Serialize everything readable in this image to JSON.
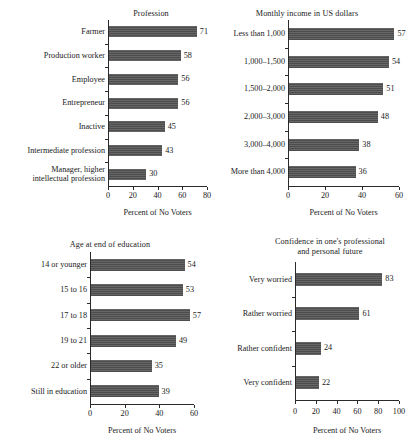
{
  "figure": {
    "shared_xlabel": "Percent of No Voters",
    "bar_color": "#4d4d4d",
    "axis_color": "#2a2a2a",
    "background": "#ffffff"
  },
  "chart_data": [
    {
      "type": "bar",
      "orientation": "horizontal",
      "panel": "top-left",
      "title": "Profession",
      "xlabel": "Percent of No Voters",
      "ylabel": "",
      "xlim": [
        0,
        80
      ],
      "xticks": [
        0,
        20,
        40,
        60,
        80
      ],
      "grid": false,
      "legend": false,
      "categories": [
        "Farmer",
        "Production worker",
        "Employee",
        "Entrepreneur",
        "Inactive",
        "Intermediate profession",
        "Manager, higher\nintellectual profession"
      ],
      "values": [
        71,
        58,
        56,
        56,
        45,
        43,
        30
      ]
    },
    {
      "type": "bar",
      "orientation": "horizontal",
      "panel": "top-right",
      "title": "Monthly income in US dollars",
      "xlabel": "Percent of No Voters",
      "ylabel": "",
      "xlim": [
        0,
        60
      ],
      "xticks": [
        0,
        20,
        40,
        60
      ],
      "grid": false,
      "legend": false,
      "categories": [
        "Less than 1,000",
        "1,000–1,500",
        "1,500–2,000",
        "2,000–3,000",
        "3,000–4,000",
        "More than 4,000"
      ],
      "values": [
        57,
        54,
        51,
        48,
        38,
        36
      ]
    },
    {
      "type": "bar",
      "orientation": "horizontal",
      "panel": "bottom-left",
      "title": "Age at end of education",
      "xlabel": "Percent of No Voters",
      "ylabel": "",
      "xlim": [
        0,
        60
      ],
      "xticks": [
        0,
        20,
        40,
        60
      ],
      "grid": false,
      "legend": false,
      "categories": [
        "14 or younger",
        "15 to 16",
        "17 to 18",
        "19 to 21",
        "22 or older",
        "Still in education"
      ],
      "values": [
        54,
        53,
        57,
        49,
        35,
        39
      ]
    },
    {
      "type": "bar",
      "orientation": "horizontal",
      "panel": "bottom-right",
      "title": "Confidence in one's professional\nand personal future",
      "xlabel": "Percent of No Voters",
      "ylabel": "",
      "xlim": [
        0,
        100
      ],
      "xticks": [
        0,
        20,
        40,
        60,
        80,
        100
      ],
      "grid": false,
      "legend": false,
      "categories": [
        "Very worried",
        "Rather worried",
        "Rather confident",
        "Very confident"
      ],
      "values": [
        83,
        61,
        24,
        22
      ]
    }
  ]
}
